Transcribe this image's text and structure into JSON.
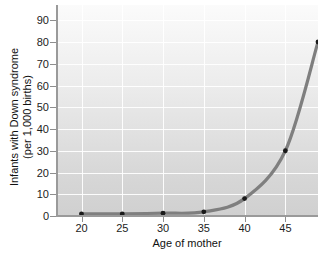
{
  "chart_data": {
    "type": "line",
    "title": "",
    "xlabel": "Age of mother",
    "ylabel_line1": "Infants with Down syndrome",
    "ylabel_line2": "(per 1,000 births)",
    "x": [
      20,
      25,
      30,
      35,
      40,
      45,
      49
    ],
    "values": [
      1,
      1,
      1.3,
      1.9,
      8,
      30,
      80
    ],
    "series": [
      {
        "name": "Infants with Down syndrome per 1,000 births",
        "points": [
          {
            "x": 20,
            "y": 1
          },
          {
            "x": 25,
            "y": 1
          },
          {
            "x": 30,
            "y": 1.3
          },
          {
            "x": 35,
            "y": 1.9
          },
          {
            "x": 40,
            "y": 8
          },
          {
            "x": 45,
            "y": 30
          },
          {
            "x": 49,
            "y": 80
          }
        ]
      }
    ],
    "xlim": [
      17,
      49
    ],
    "ylim": [
      0,
      97
    ],
    "xticks": [
      20,
      25,
      30,
      35,
      40,
      45
    ],
    "yticks": [
      0,
      10,
      20,
      30,
      40,
      50,
      60,
      70,
      80,
      90
    ],
    "xtick_labels": [
      "20",
      "25",
      "30",
      "35",
      "40",
      "45"
    ],
    "ytick_labels": [
      "0",
      "10",
      "20",
      "30",
      "40",
      "50",
      "60",
      "70",
      "80",
      "90"
    ],
    "grid": true,
    "grid_color": "#ffffff",
    "legend": "none",
    "line_color": "#7f7f7f",
    "marker_color": "#1a1a1a",
    "plot_background": "#e4e4e4",
    "axis_color": "#9a9a9a",
    "text_color": "#1c1c1c"
  }
}
